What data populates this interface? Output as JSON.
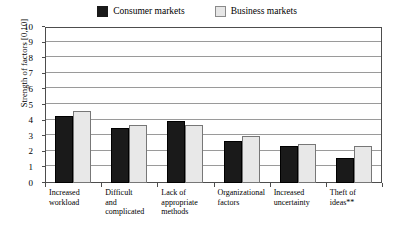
{
  "legend": {
    "entries": [
      {
        "label": "Consumer markets",
        "swatch": "dark-square-icon",
        "color": "#1a1a1a"
      },
      {
        "label": "Business markets",
        "swatch": "light-square-icon",
        "color": "#e8e8e8"
      }
    ]
  },
  "axis": {
    "y_title": "Strength of  factors [0,10]",
    "y_ticks": [
      "0",
      "1",
      "2",
      "3",
      "4",
      "5",
      "6",
      "7",
      "8",
      "9",
      "10"
    ]
  },
  "chart_data": {
    "type": "bar",
    "title": "",
    "xlabel": "",
    "ylabel": "Strength of  factors [0,10]",
    "ylim": [
      0,
      10
    ],
    "grid": true,
    "legend_position": "top-center",
    "categories": [
      "Increased workload",
      "Difficult and complicated",
      "Lack of appropriate methods",
      "Organizational factors",
      "Increased uncertainty",
      "Theft of ideas**"
    ],
    "category_lines": [
      [
        "Increased",
        "workload"
      ],
      [
        "Difficult",
        "and",
        "complicated"
      ],
      [
        "Lack of",
        "appropriate",
        "methods"
      ],
      [
        "Organizational",
        "factors"
      ],
      [
        "Increased",
        "uncertainty"
      ],
      [
        "Theft of",
        "ideas**"
      ]
    ],
    "series": [
      {
        "name": "Consumer markets",
        "color": "#1a1a1a",
        "values": [
          4.3,
          3.5,
          4.0,
          2.7,
          2.4,
          1.6
        ]
      },
      {
        "name": "Business markets",
        "color": "#e8e8e8",
        "values": [
          4.6,
          3.7,
          3.7,
          3.0,
          2.5,
          2.4
        ]
      }
    ]
  }
}
